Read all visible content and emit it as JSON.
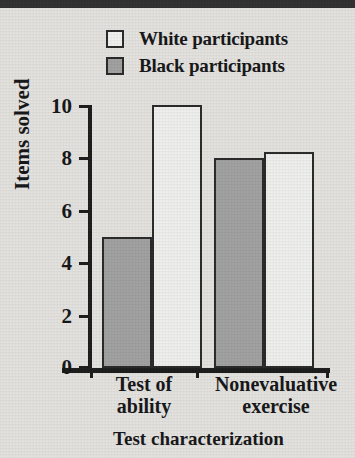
{
  "chart_data": {
    "type": "bar",
    "title": "",
    "xlabel": "Test characterization",
    "ylabel": "Items solved",
    "categories": [
      "Test of ability",
      "Nonevaluative exercise"
    ],
    "series": [
      {
        "name": "White participants",
        "color": "#f0f0ee",
        "values": [
          10.0,
          8.2
        ]
      },
      {
        "name": "Black participants",
        "color": "#a2a2a2",
        "values": [
          5.0,
          8.0
        ]
      }
    ],
    "ylim": [
      0,
      10
    ],
    "yticks": [
      0,
      2,
      4,
      6,
      8,
      10
    ],
    "grid": false,
    "legend_position": "top",
    "bar_order_in_group": [
      "Black participants",
      "White participants"
    ]
  },
  "legend": {
    "items": [
      {
        "label": "White participants",
        "swatch": "white-square-swatch"
      },
      {
        "label": "Black participants",
        "swatch": "gray-square-swatch"
      }
    ]
  },
  "axes": {
    "y_title": "Items solved",
    "x_title": "Test characterization",
    "y_tick_labels": [
      "10",
      "8",
      "6",
      "4",
      "2",
      "0"
    ],
    "category_labels": [
      {
        "line1": "Test of",
        "line2": "ability"
      },
      {
        "line1": "Nonevaluative",
        "line2": "exercise"
      }
    ]
  }
}
